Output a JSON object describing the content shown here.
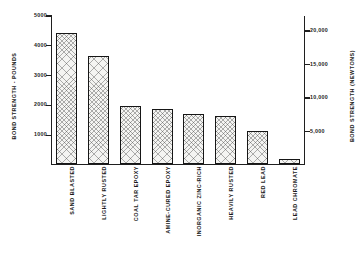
{
  "chart_data": {
    "type": "bar",
    "title": "",
    "subtitle": "",
    "xlabel": "",
    "ylabel": "BOND STRENGTH - POUNDS",
    "y2label": "BOND STRENGTH (NEWTONS)",
    "categories": [
      "SAND BLASTED",
      "LIGHTLY RUSTED",
      "COAL TAR EPOXY",
      "AMINE-CURED EPOXY",
      "INORGANIC ZINC-RICH",
      "HEAVILY RUSTED",
      "RED LEAD",
      "LEAD CHROMATE"
    ],
    "values": [
      4400,
      3650,
      1950,
      1870,
      1680,
      1630,
      1120,
      190
    ],
    "units": "pounds",
    "ylim": [
      0,
      5000
    ],
    "yticks": [
      1000,
      2000,
      3000,
      4000,
      5000
    ],
    "ytick_labels": [
      "1000",
      "2000",
      "3000",
      "4000",
      "5000"
    ],
    "y2lim": [
      0,
      22240
    ],
    "y2ticks": [
      5000,
      10000,
      15000,
      20000
    ],
    "y2tick_labels": [
      "5,000",
      "10,000",
      "15,000",
      "20,000"
    ],
    "grid": false,
    "legend": null,
    "bar_fill": "#f4f4f2",
    "bar_edge": "#161616",
    "bar_pattern": "cross-hatch",
    "background": "#ffffff"
  }
}
